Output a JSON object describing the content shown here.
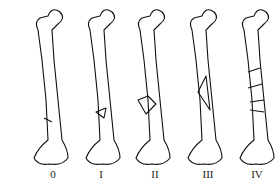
{
  "diagram": {
    "bones": [
      {
        "label": "0",
        "fracture": "none/minimal comminution"
      },
      {
        "label": "I",
        "fracture": "small butterfly fragment"
      },
      {
        "label": "II",
        "fracture": "butterfly fragment"
      },
      {
        "label": "III",
        "fracture": "large butterfly fragment"
      },
      {
        "label": "IV",
        "fracture": "segmental comminution"
      }
    ]
  }
}
